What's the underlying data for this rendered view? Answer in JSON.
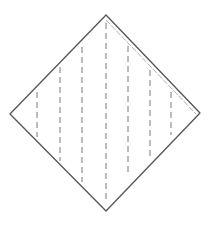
{
  "figure": {
    "title": "Folded square with dashed fold lines",
    "stroke_color": "#555555",
    "fold_color": "#9a9a9a",
    "dash_color": "#7a7a7a",
    "background": "#ffffff",
    "outline": {
      "top": [
        106,
        15
      ],
      "right": [
        200,
        113
      ],
      "bottom": [
        106,
        211
      ],
      "left": [
        10,
        114
      ]
    },
    "inner_edge": {
      "from": [
        106,
        20
      ],
      "to": [
        196,
        114
      ]
    },
    "dashed_lines": [
      {
        "x": 37,
        "y1": 92,
        "y2": 137
      },
      {
        "x": 60,
        "y1": 67,
        "y2": 161
      },
      {
        "x": 82,
        "y1": 47,
        "y2": 182
      },
      {
        "x": 106,
        "y1": 23,
        "y2": 202
      },
      {
        "x": 128,
        "y1": 46,
        "y2": 176
      },
      {
        "x": 150,
        "y1": 70,
        "y2": 158
      },
      {
        "x": 171,
        "y1": 92,
        "y2": 135
      }
    ]
  }
}
